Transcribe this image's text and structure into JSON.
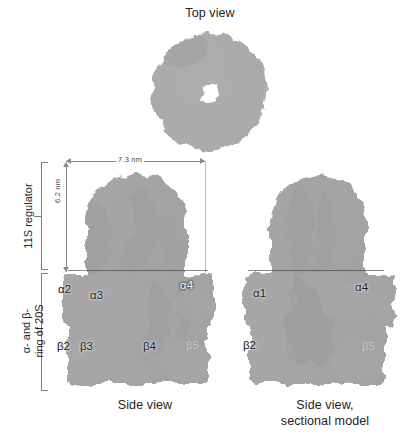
{
  "figure": {
    "background_color": "#ffffff",
    "text_color": "#222222"
  },
  "captions": {
    "top_view": "Top view",
    "side_view": "Side view",
    "side_view_sectional": "Side view,\nsectional model"
  },
  "brackets": [
    {
      "id": "11s",
      "label": "11S regulator"
    },
    {
      "id": "20s",
      "label": "α- and β-\nring of 20S"
    }
  ],
  "dimensions": {
    "width": {
      "value": "7.3 nm",
      "orientation": "horizontal"
    },
    "height": {
      "value": "6.2 nm",
      "orientation": "vertical"
    }
  },
  "panels": {
    "top_view": {
      "name": "top-view",
      "symmetry": "heptameric ring with central pore",
      "highlight": "one dark subunit at upper-left"
    },
    "side_view": {
      "name": "side-view",
      "labels": [
        {
          "text": "α2",
          "style": "dark"
        },
        {
          "text": "α3",
          "style": "dark"
        },
        {
          "text": "α4",
          "style": "light"
        },
        {
          "text": "β2",
          "style": "dark"
        },
        {
          "text": "β3",
          "style": "dark"
        },
        {
          "text": "β4",
          "style": "dark"
        },
        {
          "text": "β5",
          "style": "faint"
        }
      ]
    },
    "side_view_sectional": {
      "name": "side-view-sectional",
      "labels": [
        {
          "text": "α1",
          "style": "dark"
        },
        {
          "text": "α4",
          "style": "dark"
        },
        {
          "text": "β2",
          "style": "dark"
        },
        {
          "text": "β5",
          "style": "faint"
        }
      ]
    }
  },
  "colors": {
    "line": "#8a8a8a",
    "bracket": "#7e7e7e",
    "dim_text": "#4a4a4a",
    "surface_dark": "#1f1f1f",
    "surface_mid": "#8c8c8c",
    "surface_light": "#e6e6e6"
  }
}
